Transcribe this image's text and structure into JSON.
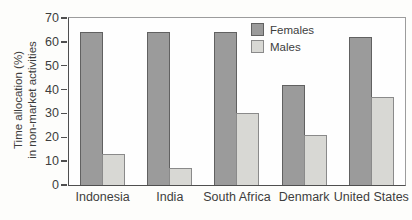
{
  "chart_data": {
    "type": "bar",
    "title": "",
    "categories": [
      "Indonesia",
      "India",
      "South Africa",
      "Denmark",
      "United States"
    ],
    "series": [
      {
        "name": "Females",
        "values": [
          64,
          64,
          64,
          42,
          62
        ],
        "fill": "#9b9b9b",
        "border": "#616161"
      },
      {
        "name": "Males",
        "values": [
          13,
          7,
          30,
          21,
          37
        ],
        "fill": "#d8d8d4",
        "border": "#8a8a8a"
      }
    ],
    "xlabel": "",
    "ylabel_line1": "Time allocation (%)",
    "ylabel_line2": "in non-market activities",
    "ylim": [
      0,
      70
    ],
    "yticks": [
      0,
      10,
      20,
      30,
      40,
      50,
      60,
      70
    ],
    "grid": false,
    "legend_position": "top-right-inside"
  },
  "colors": {
    "axis": "#4f4f4f",
    "box_light": "#9c9c9c",
    "text": "#3d3d3d",
    "background": "#fdfdfb"
  }
}
